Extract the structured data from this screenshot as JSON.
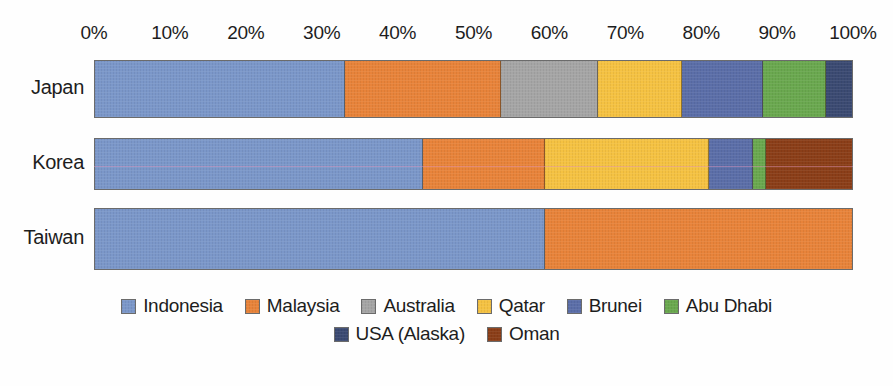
{
  "chart_data": {
    "type": "bar",
    "orientation": "horizontal",
    "stacked": true,
    "normalized": true,
    "title": "",
    "xlabel": "",
    "ylabel": "",
    "xlim": [
      0,
      100
    ],
    "grid": false,
    "legend_position": "bottom",
    "categories": [
      "Japan",
      "Korea",
      "Taiwan"
    ],
    "xticks": [
      "0%",
      "10%",
      "20%",
      "30%",
      "40%",
      "50%",
      "60%",
      "70%",
      "80%",
      "90%",
      "100%"
    ],
    "xtick_values": [
      0,
      10,
      20,
      30,
      40,
      50,
      60,
      70,
      80,
      90,
      100
    ],
    "series": [
      {
        "name": "Indonesia",
        "color": "#7b97c9",
        "values": [
          33.0,
          43.3,
          59.4
        ]
      },
      {
        "name": "Malaysia",
        "color": "#e8833a",
        "values": [
          20.6,
          16.1,
          40.6
        ]
      },
      {
        "name": "Australia",
        "color": "#a5a5a5",
        "values": [
          12.9,
          0,
          0
        ]
      },
      {
        "name": "Qatar",
        "color": "#f5c242",
        "values": [
          11.1,
          21.7,
          0
        ]
      },
      {
        "name": "Brunei",
        "color": "#5b6ea8",
        "values": [
          10.7,
          5.8,
          0
        ]
      },
      {
        "name": "Abu Dhabi",
        "color": "#6aa84f",
        "values": [
          8.3,
          1.8,
          0
        ]
      },
      {
        "name": "USA (Alaska)",
        "color": "#3b4a72",
        "values": [
          3.4,
          0,
          0
        ]
      },
      {
        "name": "Oman",
        "color": "#8b3e18",
        "values": [
          0,
          11.3,
          0
        ]
      }
    ]
  },
  "legend": {
    "row1": [
      {
        "label": "Indonesia",
        "color": "#7b97c9"
      },
      {
        "label": "Malaysia",
        "color": "#e8833a"
      },
      {
        "label": "Australia",
        "color": "#a5a5a5"
      },
      {
        "label": "Qatar",
        "color": "#f5c242"
      },
      {
        "label": "Brunei",
        "color": "#5b6ea8"
      },
      {
        "label": "Abu Dhabi",
        "color": "#6aa84f"
      }
    ],
    "row2": [
      {
        "label": "USA (Alaska)",
        "color": "#3b4a72"
      },
      {
        "label": "Oman",
        "color": "#8b3e18"
      }
    ]
  },
  "rows": [
    {
      "label": "Japan",
      "top": 10,
      "height": 58,
      "scanlines": []
    },
    {
      "label": "Korea",
      "top": 88,
      "height": 52,
      "scanlines": [
        28
      ]
    },
    {
      "label": "Taiwan",
      "top": 158,
      "height": 62,
      "scanlines": []
    }
  ]
}
